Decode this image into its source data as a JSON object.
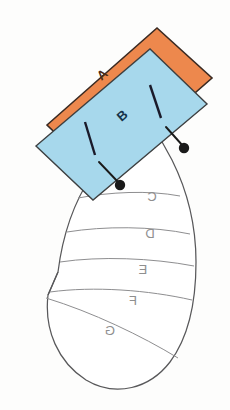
{
  "figure": {
    "canvas": {
      "width": 230,
      "height": 410,
      "background": "#fdfdfc"
    },
    "colors": {
      "orange_fill": "#ef8a4e",
      "orange_stroke": "#3a2a22",
      "blue_fill": "#aedcef",
      "blue_stroke": "#3a3a3a",
      "fan_fill": "#ffffff",
      "fan_stroke": "#58585a",
      "divider_stroke": "#8e8e90",
      "marker_fill": "#1a1a1a",
      "leader_stroke": "#1a1a1a",
      "tick_stroke": "#1a1a2a",
      "segment_label": "#8f8f8f",
      "label_a_color": "#4a2a16",
      "label_b_color": "#16344a"
    },
    "blocks": [
      {
        "id": "block-a",
        "label": "A",
        "fill": "#ef8a4e",
        "rotation_deg": -19,
        "label_x": 105,
        "label_y": 78
      },
      {
        "id": "block-b",
        "label": "B",
        "fill": "#aedcef",
        "rotation_deg": -19,
        "label_x": 125,
        "label_y": 119
      }
    ],
    "segments": [
      {
        "id": "segment-c",
        "label": "C",
        "label_x": 152,
        "label_y": 201,
        "mirrored": true
      },
      {
        "id": "segment-d",
        "label": "D",
        "label_x": 150,
        "label_y": 238,
        "mirrored": true
      },
      {
        "id": "segment-e",
        "label": "E",
        "label_x": 143,
        "label_y": 274,
        "mirrored": true
      },
      {
        "id": "segment-f",
        "label": "F",
        "label_x": 133,
        "label_y": 305,
        "mirrored": true
      },
      {
        "id": "segment-g",
        "label": "G",
        "label_x": 110,
        "label_y": 335,
        "mirrored": true
      }
    ],
    "markers": [
      {
        "id": "marker-left",
        "dot_x": 120,
        "dot_y": 184,
        "tick_x1": 85,
        "tick_y1": 124,
        "tick_x2": 91,
        "tick_y2": 146
      },
      {
        "id": "marker-right",
        "dot_x": 184,
        "dot_y": 148,
        "tick_x1": 152,
        "tick_y1": 87,
        "tick_x2": 158,
        "tick_y2": 110
      }
    ]
  }
}
